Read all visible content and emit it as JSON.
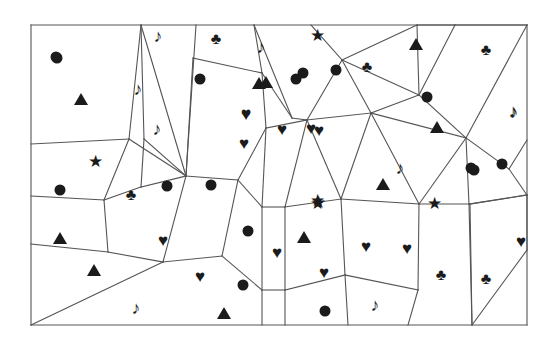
{
  "figure": {
    "stroke_color": "#555555",
    "symbol_color": "#1b1b1b",
    "background_color": "#ffffff",
    "frame": {
      "x": 31,
      "y": 25,
      "width": 496,
      "height": 300
    }
  },
  "legend": {
    "glyphs": {
      "heart": "♥",
      "club": "♣",
      "star": "★",
      "note": "♪",
      "circle": "●",
      "triangle": "▲"
    },
    "counts": {
      "heart": 13,
      "club": 7,
      "star": 5,
      "note": 9,
      "circle": 18,
      "triangle": 11
    },
    "total_symbols": 63
  },
  "edges": [
    [
      31,
      25,
      527,
      25
    ],
    [
      527,
      25,
      527,
      325
    ],
    [
      527,
      325,
      31,
      325
    ],
    [
      31,
      325,
      31,
      25
    ],
    [
      31,
      144,
      129,
      139
    ],
    [
      31,
      196,
      104,
      200
    ],
    [
      31,
      244,
      108,
      252
    ],
    [
      31,
      325,
      163,
      262
    ],
    [
      129,
      139,
      141,
      25
    ],
    [
      129,
      139,
      186,
      176
    ],
    [
      129,
      139,
      104,
      200
    ],
    [
      104,
      200,
      108,
      252
    ],
    [
      104,
      200,
      141,
      187
    ],
    [
      141,
      187,
      186,
      176
    ],
    [
      141,
      187,
      144,
      139
    ],
    [
      144,
      139,
      141,
      25
    ],
    [
      144,
      139,
      186,
      176
    ],
    [
      186,
      176,
      193,
      58
    ],
    [
      186,
      176,
      196,
      25
    ],
    [
      141,
      25,
      186,
      176
    ],
    [
      108,
      252,
      163,
      262
    ],
    [
      163,
      262,
      222,
      256
    ],
    [
      222,
      256,
      238,
      180
    ],
    [
      238,
      180,
      186,
      176
    ],
    [
      193,
      58,
      262,
      73
    ],
    [
      262,
      73,
      254,
      25
    ],
    [
      262,
      73,
      292,
      118
    ],
    [
      238,
      180,
      266,
      128
    ],
    [
      266,
      128,
      262,
      73
    ],
    [
      266,
      128,
      307,
      120
    ],
    [
      307,
      120,
      292,
      118
    ],
    [
      292,
      118,
      254,
      25
    ],
    [
      238,
      180,
      262,
      207
    ],
    [
      262,
      207,
      266,
      128
    ],
    [
      262,
      207,
      262,
      290
    ],
    [
      262,
      290,
      222,
      256
    ],
    [
      262,
      290,
      262,
      325
    ],
    [
      262,
      290,
      285,
      290
    ],
    [
      285,
      290,
      285,
      207
    ],
    [
      285,
      207,
      262,
      207
    ],
    [
      285,
      207,
      307,
      120
    ],
    [
      285,
      290,
      285,
      325
    ],
    [
      285,
      290,
      345,
      275
    ],
    [
      345,
      275,
      341,
      199
    ],
    [
      341,
      199,
      285,
      207
    ],
    [
      341,
      199,
      307,
      120
    ],
    [
      307,
      120,
      342,
      60
    ],
    [
      342,
      60,
      311,
      25
    ],
    [
      342,
      60,
      371,
      113
    ],
    [
      371,
      113,
      307,
      120
    ],
    [
      371,
      113,
      341,
      199
    ],
    [
      371,
      113,
      419,
      95
    ],
    [
      419,
      95,
      342,
      60
    ],
    [
      419,
      95,
      417,
      25
    ],
    [
      417,
      25,
      342,
      60
    ],
    [
      419,
      95,
      455,
      25
    ],
    [
      455,
      25,
      417,
      25
    ],
    [
      455,
      25,
      527,
      25
    ],
    [
      419,
      95,
      466,
      138
    ],
    [
      466,
      138,
      527,
      25
    ],
    [
      466,
      138,
      371,
      113
    ],
    [
      466,
      138,
      419,
      204
    ],
    [
      419,
      204,
      371,
      113
    ],
    [
      419,
      204,
      341,
      199
    ],
    [
      419,
      204,
      418,
      290
    ],
    [
      418,
      290,
      345,
      275
    ],
    [
      466,
      138,
      469,
      204
    ],
    [
      469,
      204,
      419,
      204
    ],
    [
      469,
      204,
      527,
      195
    ],
    [
      466,
      138,
      509,
      169
    ],
    [
      509,
      169,
      527,
      195
    ],
    [
      509,
      169,
      527,
      140
    ],
    [
      469,
      204,
      472,
      325
    ],
    [
      418,
      290,
      408,
      325
    ],
    [
      345,
      275,
      348,
      325
    ],
    [
      527,
      195,
      470,
      204
    ],
    [
      470,
      204,
      472,
      325
    ],
    [
      472,
      325,
      527,
      250
    ],
    [
      527,
      250,
      527,
      195
    ],
    [
      163,
      262,
      186,
      176
    ],
    [
      222,
      256,
      238,
      180
    ],
    [
      31,
      196,
      104,
      200
    ],
    [
      108,
      252,
      31,
      244
    ]
  ],
  "symbols": [
    {
      "type": "circle",
      "x": 56,
      "y": 57
    },
    {
      "type": "triangle",
      "x": 81,
      "y": 99
    },
    {
      "type": "note",
      "x": 138,
      "y": 89
    },
    {
      "type": "note",
      "x": 157,
      "y": 129
    },
    {
      "type": "note",
      "x": 158,
      "y": 36
    },
    {
      "type": "club",
      "x": 216,
      "y": 39
    },
    {
      "type": "note",
      "x": 261,
      "y": 47
    },
    {
      "type": "star",
      "x": 317,
      "y": 35
    },
    {
      "type": "triangle",
      "x": 416,
      "y": 44
    },
    {
      "type": "club",
      "x": 486,
      "y": 50
    },
    {
      "type": "circle",
      "x": 336,
      "y": 70
    },
    {
      "type": "club",
      "x": 367,
      "y": 67
    },
    {
      "type": "circle",
      "x": 200,
      "y": 79
    },
    {
      "type": "triangle",
      "x": 259,
      "y": 83
    },
    {
      "type": "circle",
      "x": 303,
      "y": 73
    },
    {
      "type": "circle",
      "x": 427,
      "y": 97
    },
    {
      "type": "circle",
      "x": 296,
      "y": 79
    },
    {
      "type": "note",
      "x": 513,
      "y": 111
    },
    {
      "type": "heart",
      "x": 246,
      "y": 113
    },
    {
      "type": "heart",
      "x": 282,
      "y": 129
    },
    {
      "type": "heart",
      "x": 311,
      "y": 128
    },
    {
      "type": "heart",
      "x": 244,
      "y": 143
    },
    {
      "type": "triangle",
      "x": 437,
      "y": 127
    },
    {
      "type": "star",
      "x": 95,
      "y": 161
    },
    {
      "type": "note",
      "x": 400,
      "y": 168
    },
    {
      "type": "circle",
      "x": 471,
      "y": 168
    },
    {
      "type": "circle",
      "x": 502,
      "y": 164
    },
    {
      "type": "circle",
      "x": 60,
      "y": 190
    },
    {
      "type": "club",
      "x": 131,
      "y": 195
    },
    {
      "type": "circle",
      "x": 167,
      "y": 186
    },
    {
      "type": "circle",
      "x": 211,
      "y": 185
    },
    {
      "type": "triangle",
      "x": 383,
      "y": 184
    },
    {
      "type": "star",
      "x": 317,
      "y": 200
    },
    {
      "type": "triangle",
      "x": 60,
      "y": 238
    },
    {
      "type": "star",
      "x": 317,
      "y": 203
    },
    {
      "type": "star",
      "x": 434,
      "y": 203
    },
    {
      "type": "heart",
      "x": 163,
      "y": 240
    },
    {
      "type": "circle",
      "x": 248,
      "y": 231
    },
    {
      "type": "triangle",
      "x": 304,
      "y": 237
    },
    {
      "type": "heart",
      "x": 277,
      "y": 252
    },
    {
      "type": "heart",
      "x": 366,
      "y": 246
    },
    {
      "type": "heart",
      "x": 407,
      "y": 248
    },
    {
      "type": "heart",
      "x": 521,
      "y": 241
    },
    {
      "type": "triangle",
      "x": 94,
      "y": 270
    },
    {
      "type": "heart",
      "x": 200,
      "y": 276
    },
    {
      "type": "circle",
      "x": 243,
      "y": 285
    },
    {
      "type": "heart",
      "x": 324,
      "y": 272
    },
    {
      "type": "club",
      "x": 441,
      "y": 275
    },
    {
      "type": "club",
      "x": 486,
      "y": 279
    },
    {
      "type": "note",
      "x": 136,
      "y": 308
    },
    {
      "type": "triangle",
      "x": 224,
      "y": 313
    },
    {
      "type": "circle",
      "x": 325,
      "y": 311
    },
    {
      "type": "note",
      "x": 375,
      "y": 305
    },
    {
      "type": "triangle",
      "x": 266,
      "y": 82
    },
    {
      "type": "heart",
      "x": 319,
      "y": 130
    },
    {
      "type": "star",
      "x": 318,
      "y": 202
    },
    {
      "type": "heart",
      "x": 163,
      "y": 241
    },
    {
      "type": "circle",
      "x": 474,
      "y": 170
    },
    {
      "type": "note",
      "x": 514,
      "y": 112
    },
    {
      "type": "heart",
      "x": 408,
      "y": 249
    },
    {
      "type": "circle",
      "x": 57,
      "y": 58
    },
    {
      "type": "heart",
      "x": 246,
      "y": 114
    },
    {
      "type": "club",
      "x": 487,
      "y": 280
    }
  ]
}
